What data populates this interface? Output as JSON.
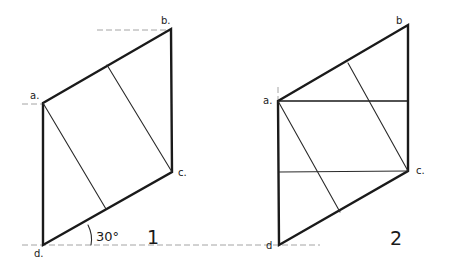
{
  "figures": [
    {
      "number_label": "1",
      "angle_label": "30°",
      "vertices": {
        "a": {
          "label": "a.",
          "x": 43,
          "y": 103
        },
        "b": {
          "label": "b.",
          "x": 171,
          "y": 29
        },
        "c": {
          "label": "c.",
          "x": 172,
          "y": 172
        },
        "d": {
          "label": "d.",
          "x": 43,
          "y": 245
        }
      }
    },
    {
      "number_label": "2",
      "vertices": {
        "a": {
          "label": "a.",
          "x": 278,
          "y": 101
        },
        "b": {
          "label": "b",
          "x": 408,
          "y": 25
        },
        "c": {
          "label": "c.",
          "x": 408,
          "y": 171
        },
        "d": {
          "label": "d",
          "x": 279,
          "y": 245
        }
      }
    }
  ]
}
